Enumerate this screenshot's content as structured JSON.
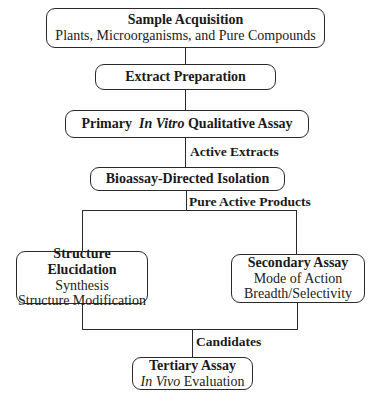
{
  "diagram": {
    "type": "flowchart",
    "nodes": {
      "sample_acquisition": {
        "title": "Sample Acquisition",
        "subtitle": "Plants, Microorganisms, and Pure Compounds"
      },
      "extract_preparation": {
        "title": "Extract Preparation"
      },
      "primary_assay": {
        "title_prefix": "Primary",
        "title_italic": "In Vitro",
        "title_suffix": "Qualitative Assay"
      },
      "bioassay_isolation": {
        "title": "Bioassay-Directed Isolation"
      },
      "structure_elucidation": {
        "title": "Structure Elucidation",
        "lines": [
          "Synthesis",
          "Structure Modification"
        ]
      },
      "secondary_assay": {
        "title": "Secondary Assay",
        "lines": [
          "Mode of Action",
          "Breadth/Selectivity"
        ]
      },
      "tertiary_assay": {
        "title": "Tertiary Assay",
        "line_italic": "In Vivo",
        "line_suffix": "Evaluation"
      }
    },
    "edge_labels": {
      "active_extracts": "Active Extracts",
      "pure_active_products": "Pure Active Products",
      "candidates": "Candidates"
    },
    "edges": [
      [
        "sample_acquisition",
        "extract_preparation"
      ],
      [
        "extract_preparation",
        "primary_assay"
      ],
      [
        "primary_assay",
        "bioassay_isolation",
        "Active Extracts"
      ],
      [
        "bioassay_isolation",
        "structure_elucidation",
        "Pure Active Products"
      ],
      [
        "bioassay_isolation",
        "secondary_assay",
        "Pure Active Products"
      ],
      [
        "structure_elucidation",
        "tertiary_assay",
        "Candidates"
      ],
      [
        "secondary_assay",
        "tertiary_assay",
        "Candidates"
      ]
    ]
  }
}
